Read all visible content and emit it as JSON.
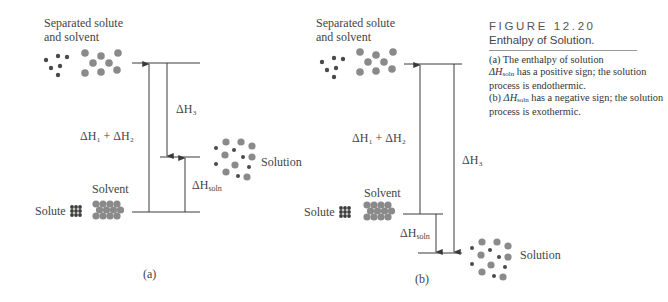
{
  "figure": {
    "number_label": "FIGURE 12.20",
    "title": "Enthalpy of Solution.",
    "caption_a_prefix": "(a) The enthalpy of solution",
    "caption_a_dh": "ΔH",
    "caption_a_sub": "soln",
    "caption_a_rest": " has a positive sign; the solution process is endothermic.",
    "caption_b_prefix": "(b) ",
    "caption_b_dh": "ΔH",
    "caption_b_sub": "soln",
    "caption_b_rest": " has a negative sign; the solution process is exothermic."
  },
  "panel_a": {
    "label": "(a)",
    "separated_line1": "Separated solute",
    "separated_line2": "and solvent",
    "dh12": "ΔH₁ + ΔH₂",
    "dh3": "ΔH₃",
    "dhsoln": "ΔH",
    "dhsoln_sub": "soln",
    "solution_label": "Solution",
    "solvent_label": "Solvent",
    "solute_label": "Solute",
    "sign": "positive",
    "process": "endothermic"
  },
  "panel_b": {
    "label": "(b)",
    "separated_line1": "Separated solute",
    "separated_line2": "and solvent",
    "dh12": "ΔH₁ + ΔH₂",
    "dh3": "ΔH₃",
    "dhsoln": "ΔH",
    "dhsoln_sub": "soln",
    "solution_label": "Solution",
    "solvent_label": "Solvent",
    "solute_label": "Solute",
    "sign": "negative",
    "process": "exothermic"
  },
  "colors": {
    "line": "#3a3a3a",
    "solute_dot": "#4a4a4a",
    "solvent_dot": "#8a8a8a"
  }
}
